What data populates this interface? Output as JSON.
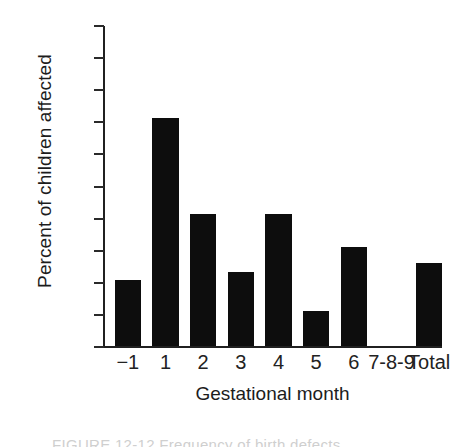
{
  "chart_data": {
    "type": "bar",
    "title": "",
    "subtitle": "",
    "xlabel": "Gestational month",
    "ylabel": "Percent of children affected",
    "categories": [
      "−1",
      "1",
      "2",
      "3",
      "4",
      "5",
      "6",
      "7-8-9",
      "Total"
    ],
    "values": [
      20.5,
      71,
      41,
      23,
      41,
      11,
      31,
      0,
      26
    ],
    "series": [
      {
        "name": "Percent of children affected",
        "values": [
          20.5,
          71,
          41,
          23,
          41,
          11,
          31,
          0,
          26
        ]
      }
    ],
    "ylim": [
      0,
      100
    ],
    "yticks": [
      0,
      10,
      20,
      30,
      40,
      50,
      60,
      70,
      80,
      90,
      100
    ],
    "ytick_labels": [
      "0",
      "10",
      "20",
      "30",
      "40",
      "50",
      "60",
      "70",
      "80",
      "90",
      "100"
    ],
    "grid": false,
    "legend": false,
    "legend_position": "none",
    "bar_color": "#0d0d0d",
    "axis_color": "#202020",
    "background_color": "#ffffff"
  },
  "figure": {
    "y_axis_title": "Percent of children affected",
    "x_axis_title": "Gestational month",
    "caption_partial": "FIGURE 12-12  Frequency of birth defects"
  }
}
